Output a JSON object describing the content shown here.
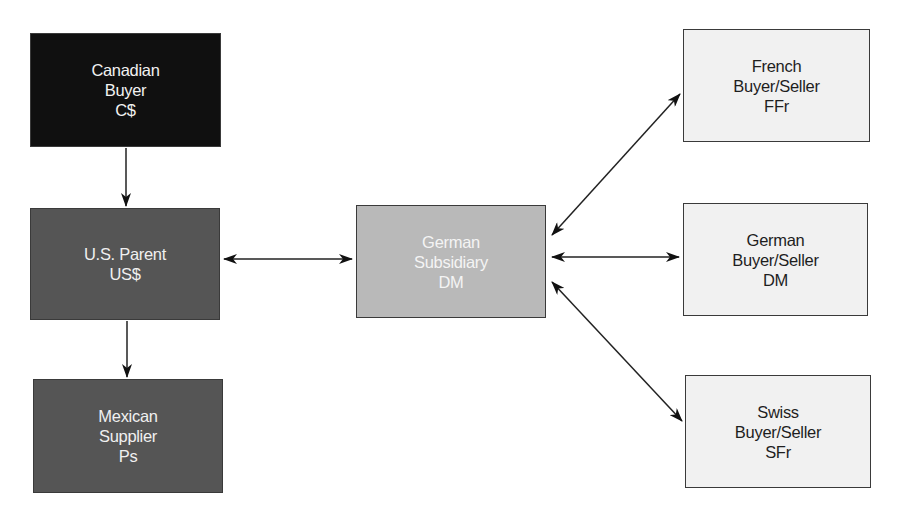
{
  "diagram": {
    "nodes": [
      {
        "id": "canadian-buyer",
        "lines": [
          "Canadian",
          "Buyer",
          "C$"
        ],
        "fill": "#101010"
      },
      {
        "id": "us-parent",
        "lines": [
          "U.S. Parent",
          "US$"
        ],
        "fill": "#555555"
      },
      {
        "id": "mexican-supplier",
        "lines": [
          "Mexican",
          "Supplier",
          "Ps"
        ],
        "fill": "#555555"
      },
      {
        "id": "german-subsidiary",
        "lines": [
          "German",
          "Subsidiary",
          "DM"
        ],
        "fill": "#b9b9b9"
      },
      {
        "id": "french-buyer-seller",
        "lines": [
          "French",
          "Buyer/Seller",
          "FFr"
        ],
        "fill": "#f1f1f1"
      },
      {
        "id": "german-buyer-seller",
        "lines": [
          "German",
          "Buyer/Seller",
          "DM"
        ],
        "fill": "#f1f1f1"
      },
      {
        "id": "swiss-buyer-seller",
        "lines": [
          "Swiss",
          "Buyer/Seller",
          "SFr"
        ],
        "fill": "#f1f1f1"
      }
    ],
    "edges": [
      {
        "from": "canadian-buyer",
        "to": "us-parent",
        "direction": "one-way"
      },
      {
        "from": "us-parent",
        "to": "mexican-supplier",
        "direction": "one-way"
      },
      {
        "from": "us-parent",
        "to": "german-subsidiary",
        "direction": "two-way"
      },
      {
        "from": "german-subsidiary",
        "to": "french-buyer-seller",
        "direction": "two-way"
      },
      {
        "from": "german-subsidiary",
        "to": "german-buyer-seller",
        "direction": "two-way"
      },
      {
        "from": "german-subsidiary",
        "to": "swiss-buyer-seller",
        "direction": "two-way"
      }
    ]
  }
}
